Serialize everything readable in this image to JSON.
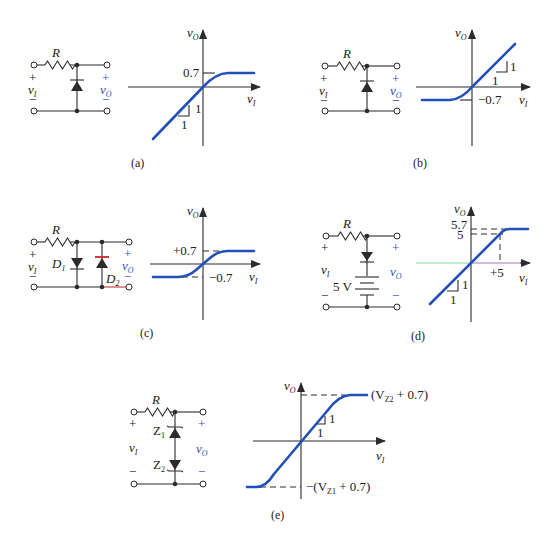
{
  "figure": {
    "panels": [
      {
        "id": "a",
        "caption": "(a)",
        "circuit": {
          "resistor_label": "R",
          "input_label": "v",
          "input_sub": "I",
          "output_label": "v",
          "output_sub": "O",
          "plus": "+",
          "minus": "−",
          "element": "diode (anode up)"
        },
        "graph": {
          "y_label": "v",
          "y_sub": "O",
          "x_label": "v",
          "x_sub": "I",
          "level_label": "0.7",
          "slope_rise": "1",
          "slope_run": "1"
        }
      },
      {
        "id": "b",
        "caption": "(b)",
        "circuit": {
          "resistor_label": "R",
          "input_label": "v",
          "input_sub": "I",
          "output_label": "v",
          "output_sub": "O",
          "plus": "+",
          "minus": "−",
          "element": "diode (cathode up)"
        },
        "graph": {
          "y_label": "v",
          "y_sub": "O",
          "x_label": "v",
          "x_sub": "I",
          "level_label": "−0.7",
          "slope_rise": "1",
          "slope_run": "1"
        }
      },
      {
        "id": "c",
        "caption": "(c)",
        "circuit": {
          "resistor_label": "R",
          "input_label": "v",
          "input_sub": "I",
          "output_label": "v",
          "output_sub": "O",
          "plus": "+",
          "minus": "−",
          "d1_label": "D",
          "d1_sub": "1",
          "d2_label": "D",
          "d2_sub": "2"
        },
        "graph": {
          "y_label": "v",
          "y_sub": "O",
          "x_label": "v",
          "x_sub": "I",
          "upper_label": "+0.7",
          "lower_label": "−0.7"
        }
      },
      {
        "id": "d",
        "caption": "(d)",
        "circuit": {
          "resistor_label": "R",
          "input_label": "v",
          "input_sub": "I",
          "output_label": "v",
          "output_sub": "O",
          "plus": "+",
          "minus": "−",
          "battery_label": "5 V"
        },
        "graph": {
          "y_label": "v",
          "y_sub": "O",
          "x_label": "v",
          "x_sub": "I",
          "level_top": "5.7",
          "level_5": "5",
          "x_tick": "+5",
          "slope_rise": "1",
          "slope_run": "1"
        }
      },
      {
        "id": "e",
        "caption": "(e)",
        "circuit": {
          "resistor_label": "R",
          "input_label": "v",
          "input_sub": "I",
          "output_label": "v",
          "output_sub": "O",
          "plus": "+",
          "minus": "−",
          "z1_label": "Z",
          "z1_sub": "1",
          "z2_label": "Z",
          "z2_sub": "2"
        },
        "graph": {
          "y_label": "v",
          "y_sub": "O",
          "x_label": "v",
          "x_sub": "I",
          "upper_label_pre": "(V",
          "upper_label_sub": "Z2",
          "upper_label_post": " + 0.7)",
          "lower_label_pre": "−(V",
          "lower_label_sub": "Z1",
          "lower_label_post": " + 0.7)",
          "slope_rise": "1",
          "slope_run": "1"
        }
      }
    ],
    "colors": {
      "curve": "#2350b8",
      "output_label": "#2a55b0",
      "wire": "#2b2b2b"
    }
  }
}
